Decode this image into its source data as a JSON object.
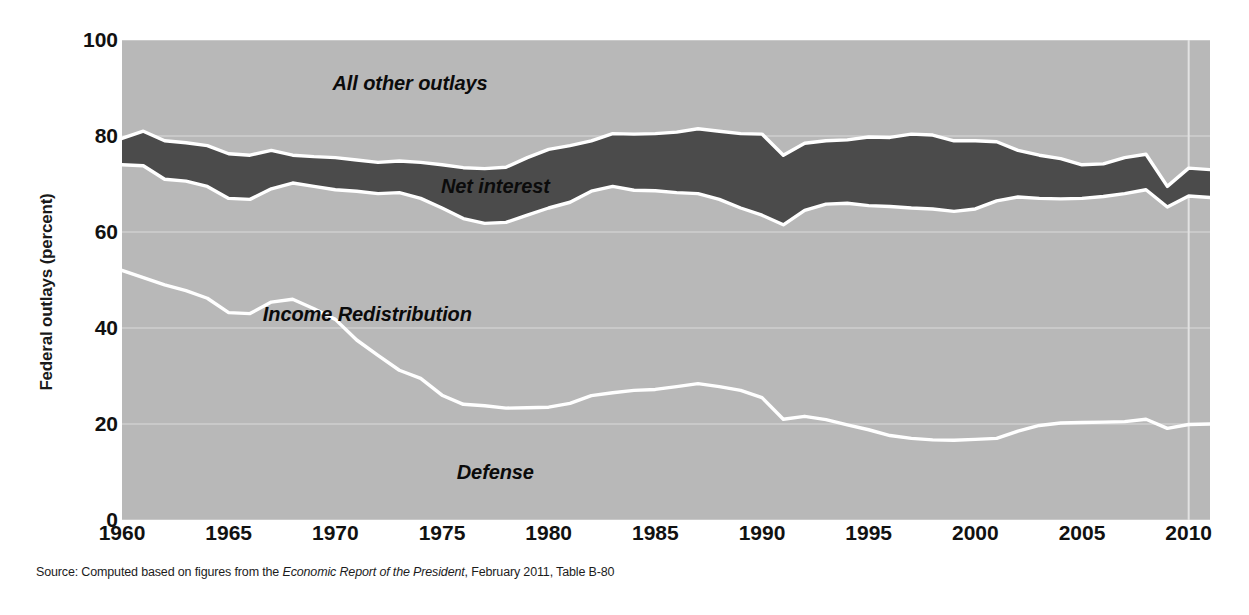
{
  "figure": {
    "y_axis_title": "Federal outlays (percent)",
    "source_prefix": "Source: Computed based on figures from the ",
    "source_italic": "Economic Report of the President",
    "source_suffix": ", February 2011, Table B-80"
  },
  "colors": {
    "light_band": "#b8b8b8",
    "dark_band": "#4b4b4b",
    "boundary_line": "#ffffff",
    "gridline": "#cfcfcf",
    "text": "#111111",
    "background": "#ffffff"
  },
  "chart_data": {
    "type": "area",
    "title": "",
    "subtitle": "",
    "xlabel": "",
    "ylabel": "Federal outlays (percent)",
    "xlim": [
      1960,
      2011
    ],
    "ylim": [
      0,
      100
    ],
    "grid": true,
    "grid_axis": "y",
    "legend_position": "inline-annotations",
    "stacked": true,
    "ytick_labels": [
      "0",
      "20",
      "40",
      "60",
      "80",
      "100"
    ],
    "ytick_values": [
      0,
      20,
      40,
      60,
      80,
      100
    ],
    "xtick_labels": [
      "1960",
      "1965",
      "1970",
      "1975",
      "1980",
      "1985",
      "1990",
      "1995",
      "2000",
      "2005",
      "2010"
    ],
    "xtick_values": [
      1960,
      1965,
      1970,
      1975,
      1980,
      1985,
      1990,
      1995,
      2000,
      2005,
      2010
    ],
    "x": [
      1960,
      1961,
      1962,
      1963,
      1964,
      1965,
      1966,
      1967,
      1968,
      1969,
      1970,
      1971,
      1972,
      1973,
      1974,
      1975,
      1976,
      1977,
      1978,
      1979,
      1980,
      1981,
      1982,
      1983,
      1984,
      1985,
      1986,
      1987,
      1988,
      1989,
      1990,
      1991,
      1992,
      1993,
      1994,
      1995,
      1996,
      1997,
      1998,
      1999,
      2000,
      2001,
      2002,
      2003,
      2004,
      2005,
      2006,
      2007,
      2008,
      2009,
      2010,
      2011
    ],
    "annotations": [
      {
        "text": "All other outlays",
        "x": 1973.5,
        "y": 91
      },
      {
        "text": "Net interest",
        "x": 1977.5,
        "y": 69.5
      },
      {
        "text": "Income Redistribution",
        "x": 1971.5,
        "y": 43
      },
      {
        "text": "Defense",
        "x": 1977.5,
        "y": 10
      }
    ],
    "series": [
      {
        "name": "Defense",
        "band": "bottom",
        "fill": "#b8b8b8",
        "upper_boundary_label": "Defense share (cumulative, percent)",
        "values": [
          52.0,
          50.5,
          49.0,
          47.8,
          46.2,
          43.2,
          43.0,
          45.4,
          46.0,
          44.0,
          41.8,
          37.5,
          34.3,
          31.2,
          29.5,
          26.0,
          24.1,
          23.8,
          23.3,
          23.4,
          23.5,
          24.3,
          25.9,
          26.5,
          27.0,
          27.2,
          27.8,
          28.4,
          27.8,
          27.0,
          25.5,
          21.0,
          21.6,
          20.9,
          19.8,
          18.8,
          17.6,
          17.0,
          16.7,
          16.6,
          16.8,
          17.0,
          18.5,
          19.7,
          20.2,
          20.3,
          20.4,
          20.5,
          21.0,
          19.1,
          19.9,
          20.0
        ],
        "units": "percent of federal outlays"
      },
      {
        "name": "Income Redistribution",
        "band": "middle-light",
        "fill": "#b8b8b8",
        "cumulative_upper": [
          74.0,
          73.8,
          71.0,
          70.6,
          69.5,
          67.0,
          66.8,
          69.0,
          70.2,
          69.5,
          68.8,
          68.5,
          68.0,
          68.2,
          67.0,
          65.0,
          62.8,
          61.8,
          62.0,
          63.5,
          65.0,
          66.2,
          68.5,
          69.5,
          68.7,
          68.6,
          68.2,
          68.0,
          66.8,
          65.0,
          63.5,
          61.5,
          64.5,
          65.8,
          66.0,
          65.5,
          65.3,
          65.0,
          64.8,
          64.3,
          64.8,
          66.5,
          67.3,
          67.0,
          66.9,
          67.0,
          67.4,
          68.0,
          68.8,
          65.2,
          67.5,
          67.2
        ],
        "units": "percent of federal outlays"
      },
      {
        "name": "Net interest",
        "band": "dark",
        "fill": "#4b4b4b",
        "cumulative_upper": [
          79.5,
          81.0,
          79.0,
          78.6,
          78.0,
          76.3,
          76.0,
          77.0,
          76.0,
          75.7,
          75.5,
          75.0,
          74.5,
          74.8,
          74.5,
          74.0,
          73.4,
          73.2,
          73.5,
          75.5,
          77.2,
          78.0,
          79.0,
          80.5,
          80.4,
          80.5,
          80.8,
          81.5,
          81.0,
          80.5,
          80.4,
          76.0,
          78.5,
          79.0,
          79.2,
          79.8,
          79.7,
          80.4,
          80.2,
          79.0,
          79.0,
          78.8,
          77.0,
          76.0,
          75.3,
          74.0,
          74.2,
          75.5,
          76.2,
          69.5,
          73.3,
          73.0
        ],
        "units": "percent of federal outlays"
      },
      {
        "name": "All other outlays",
        "band": "top-light",
        "fill": "#b8b8b8",
        "cumulative_upper": [
          100,
          100,
          100,
          100,
          100,
          100,
          100,
          100,
          100,
          100,
          100,
          100,
          100,
          100,
          100,
          100,
          100,
          100,
          100,
          100,
          100,
          100,
          100,
          100,
          100,
          100,
          100,
          100,
          100,
          100,
          100,
          100,
          100,
          100,
          100,
          100,
          100,
          100,
          100,
          100,
          100,
          100,
          100,
          100,
          100,
          100,
          100,
          100,
          100,
          100,
          100,
          100
        ],
        "units": "percent of federal outlays"
      }
    ]
  }
}
